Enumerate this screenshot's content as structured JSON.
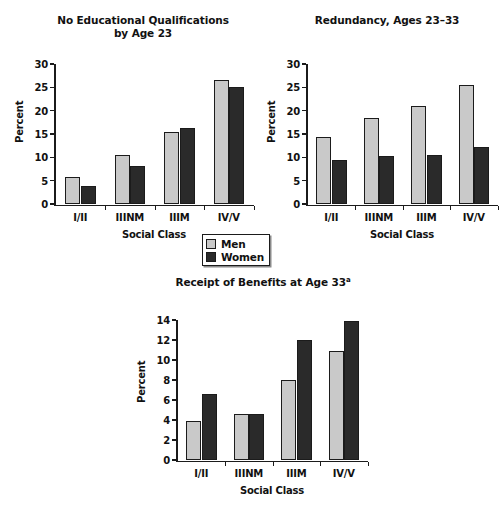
{
  "figure": {
    "ylabel": "Percent",
    "xlabel": "Social Class",
    "categories": [
      "I/II",
      "IIINM",
      "IIIM",
      "IV/V"
    ]
  },
  "legend": {
    "position": "below-top-charts-center",
    "items": [
      {
        "label": "Men",
        "color": "#c9c9c9"
      },
      {
        "label": "Women",
        "color": "#2a2a2a"
      }
    ]
  },
  "chart_data": [
    {
      "type": "bar",
      "id": "no-educational-qualifications",
      "title": "No Educational Qualifications by Age 23",
      "title_line1": "No Educational Qualifications",
      "title_line2": "by Age 23",
      "xlabel": "Social Class",
      "ylabel": "Percent",
      "categories": [
        "I/II",
        "IIINM",
        "IIIM",
        "IV/V"
      ],
      "ylim": [
        0,
        30
      ],
      "yticks": [
        0,
        5,
        10,
        15,
        20,
        25,
        30
      ],
      "grid": false,
      "legend_position": "outside-bottom-center",
      "series": [
        {
          "name": "Men",
          "color": "#c9c9c9",
          "values": [
            5.8,
            10.6,
            15.4,
            26.5
          ]
        },
        {
          "name": "Women",
          "color": "#2a2a2a",
          "values": [
            3.9,
            8.2,
            16.3,
            25.1
          ]
        }
      ]
    },
    {
      "type": "bar",
      "id": "redundancy-ages-23-33",
      "title": "Redundancy, Ages 23–33",
      "title_line1": "Redundancy, Ages 23–33",
      "title_line2": "",
      "xlabel": "Social Class",
      "ylabel": "Percent",
      "categories": [
        "I/II",
        "IIINM",
        "IIIM",
        "IV/V"
      ],
      "ylim": [
        0,
        30
      ],
      "yticks": [
        0,
        5,
        10,
        15,
        20,
        25,
        30
      ],
      "grid": false,
      "legend_position": "outside-bottom-center",
      "series": [
        {
          "name": "Men",
          "color": "#c9c9c9",
          "values": [
            14.3,
            18.4,
            21.0,
            25.6
          ]
        },
        {
          "name": "Women",
          "color": "#2a2a2a",
          "values": [
            9.4,
            10.2,
            10.4,
            12.3
          ]
        }
      ]
    },
    {
      "type": "bar",
      "id": "receipt-of-benefits-age-33",
      "title": "Receipt of Benefits at Age 33",
      "title_line1": "Receipt of Benefits at Age 33",
      "title_superscript": "a",
      "xlabel": "Social Class",
      "ylabel": "Percent",
      "categories": [
        "I/II",
        "IIINM",
        "IIIM",
        "IV/V"
      ],
      "ylim": [
        0,
        14
      ],
      "yticks": [
        0,
        2,
        4,
        6,
        8,
        10,
        12,
        14
      ],
      "grid": false,
      "series": [
        {
          "name": "Men",
          "color": "#c9c9c9",
          "values": [
            3.9,
            4.6,
            8.0,
            10.9
          ]
        },
        {
          "name": "Women",
          "color": "#2a2a2a",
          "values": [
            6.6,
            4.6,
            12.0,
            13.9
          ]
        }
      ]
    }
  ]
}
